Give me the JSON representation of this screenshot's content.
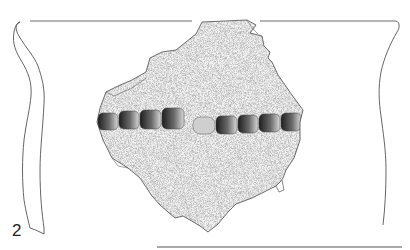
{
  "figure": {
    "number_label": "2",
    "type": "pottery sherd drawing with rim profile",
    "colors": {
      "line": "#555555",
      "stipple": "#9a9a9a",
      "impression_dark": "#2a2a2a",
      "background": "#ffffff"
    }
  },
  "elements": {
    "rim_line_left": "rim diameter line (left)",
    "rim_line_right": "rim diameter line (right)",
    "left_profile": "wall section profile",
    "right_profile": "outer contour profile",
    "sherd": "decorated body sherd",
    "impressed_band_left_count": 4,
    "impressed_band_right_count": 5,
    "base_line": "base scale line"
  }
}
